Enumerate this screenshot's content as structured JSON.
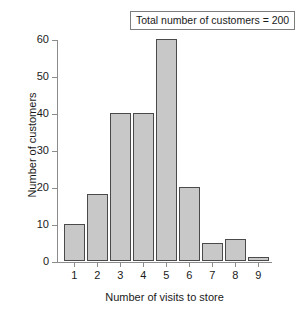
{
  "chart_data": {
    "type": "bar",
    "title": "",
    "xlabel": "Number of visits to store",
    "ylabel": "Number of customers",
    "categories": [
      "1",
      "2",
      "3",
      "4",
      "5",
      "6",
      "7",
      "8",
      "9"
    ],
    "values": [
      10,
      18,
      40,
      40,
      60,
      20,
      5,
      6,
      1
    ],
    "ylim": [
      0,
      60
    ],
    "yticks": [
      0,
      10,
      20,
      30,
      40,
      50,
      60
    ],
    "ytick_labels": [
      "0",
      "10",
      "20",
      "30",
      "40",
      "50",
      "60"
    ],
    "grid": false,
    "legend": "none",
    "annotation": "Total number of customers = 200",
    "annotation_position": "top-right",
    "bar_color": "#c8c8c8",
    "bar_edge_color": "#4a4a4a",
    "axis_color": "#8c8c8c",
    "background": "#ffffff"
  }
}
